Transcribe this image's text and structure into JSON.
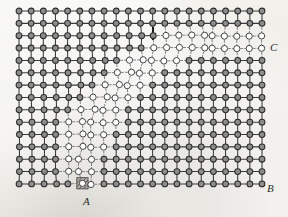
{
  "figure": {
    "type": "lattice-dislocation-diagram",
    "background_color": "#eeece7",
    "bond_color": "#3a3a3a",
    "dashed_bond_color": "#6f6f6f",
    "filled_atom_fill": "#8d8d8d",
    "filled_atom_stroke": "#2e2e2e",
    "open_atom_fill": "#ffffff",
    "open_atom_stroke": "#3d3d3d",
    "core_hatch_color": "#4a4a4a"
  },
  "labels": {
    "a": "A",
    "b": "B",
    "c": "C"
  },
  "lattice": {
    "columns": 21,
    "rows": 15,
    "x_origin": 19,
    "y_origin": 11,
    "spacing_x": 12.15,
    "spacing_y": 12.35,
    "atom_radius_filled": 2.9,
    "atom_radius_open": 3.1,
    "description": "Square lattice of 21 x 15 atoms. Atoms left of and below the slip boundary are drawn filled with solid bonds; atoms inside the sheared wedge are drawn as open circles joined by dashed bonds.",
    "open_region": {
      "note": "Per-row index of the first open-circle column and the last open-circle column (inclusive, 0-based). Rows not listed are entirely filled.",
      "rows": [
        {
          "row": 2,
          "start": 12,
          "end": 20
        },
        {
          "row": 3,
          "start": 11,
          "end": 20
        },
        {
          "row": 4,
          "start": 9,
          "end": 13
        },
        {
          "row": 5,
          "start": 8,
          "end": 11
        },
        {
          "row": 6,
          "start": 7,
          "end": 10
        },
        {
          "row": 7,
          "start": 6,
          "end": 9
        },
        {
          "row": 8,
          "start": 5,
          "end": 8
        },
        {
          "row": 9,
          "start": 4,
          "end": 8
        },
        {
          "row": 10,
          "start": 4,
          "end": 7
        },
        {
          "row": 11,
          "start": 4,
          "end": 7
        },
        {
          "row": 12,
          "start": 4,
          "end": 6
        },
        {
          "row": 13,
          "start": 4,
          "end": 6
        },
        {
          "row": 14,
          "start": 5,
          "end": 6
        }
      ]
    },
    "dislocation_core": {
      "label_ref": "A",
      "column": 5,
      "row": 14,
      "style": "hatched-shaded-square"
    },
    "marker_segment": {
      "note": "Short heavy vertical tick marking the top of the slip plane",
      "x": 153,
      "y_top": 27,
      "y_bottom": 40
    }
  },
  "points": [
    {
      "name": "A",
      "x": 85,
      "y": 190,
      "meaning": "dislocation core at the foot of the slip plane"
    },
    {
      "name": "B",
      "x": 268,
      "y": 186,
      "meaning": "bottom-right corner of the lattice"
    },
    {
      "name": "C",
      "x": 271,
      "y": 47,
      "meaning": "right edge where the slipped band exits"
    }
  ]
}
